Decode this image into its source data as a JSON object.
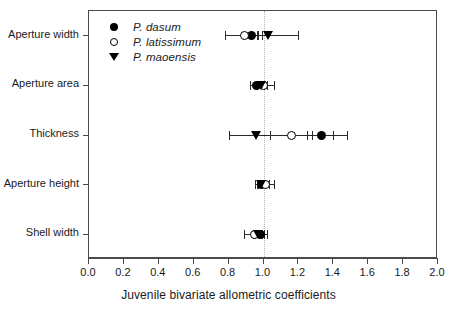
{
  "chart_data": {
    "type": "scatter",
    "title": "",
    "xlabel": "Juvenile bivariate allometric coefficients",
    "ylabel": "",
    "xlim": [
      0.0,
      2.0
    ],
    "xticks": [
      "0.0",
      "0.2",
      "0.4",
      "0.6",
      "0.8",
      "1.0",
      "1.2",
      "1.4",
      "1.6",
      "1.8",
      "2.0"
    ],
    "xtick_values": [
      0.0,
      0.2,
      0.4,
      0.6,
      0.8,
      1.0,
      1.2,
      1.4,
      1.6,
      1.8,
      2.0
    ],
    "grid": false,
    "reference_line": 1.0,
    "legend_position": "top-left",
    "orientation": "horizontal",
    "categories": [
      "Aperture width",
      "Aperture area",
      "Thickness",
      "Aperture height",
      "Shell width"
    ],
    "series": [
      {
        "name": "P. dasum",
        "marker": "filled-circle",
        "color": "#000000",
        "values": [
          0.93,
          0.96,
          1.33,
          0.99,
          0.98
        ],
        "ci_low": [
          0.88,
          0.92,
          1.25,
          0.95,
          0.94
        ],
        "ci_high": [
          0.99,
          1.0,
          1.4,
          1.03,
          1.02
        ]
      },
      {
        "name": "P. latissimum",
        "marker": "open-circle",
        "color": "#000000",
        "values": [
          0.89,
          1.0,
          1.16,
          1.01,
          0.95
        ],
        "ci_low": [
          0.78,
          0.96,
          1.04,
          0.96,
          0.89
        ],
        "ci_high": [
          0.97,
          1.06,
          1.28,
          1.06,
          1.0
        ]
      },
      {
        "name": "P. maoensis",
        "marker": "triangle-down",
        "color": "#000000",
        "values": [
          1.03,
          0.99,
          0.96,
          0.99,
          0.97
        ],
        "ci_low": [
          0.96,
          0.96,
          0.8,
          0.97,
          0.95
        ],
        "ci_high": [
          1.2,
          1.02,
          1.48,
          1.01,
          0.99
        ]
      }
    ]
  },
  "legend": {
    "items": [
      {
        "label": "P. dasum",
        "marker": "filled-circle"
      },
      {
        "label": "P. latissimum",
        "marker": "open-circle"
      },
      {
        "label": "P. maoensis",
        "marker": "triangle-down"
      }
    ]
  },
  "axis": {
    "x_title": "Juvenile bivariate allometric coefficients"
  }
}
